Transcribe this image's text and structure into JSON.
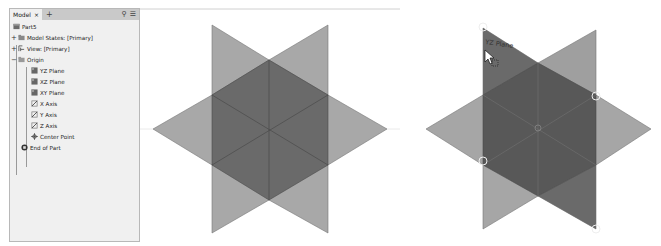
{
  "browser": {
    "tab_label": "Model",
    "tab_close": "×",
    "add_tab": "+",
    "search_icon": "search-icon",
    "menu_icon": "menu-icon",
    "tree": [
      {
        "label": "Part5",
        "icon": "part-icon",
        "level": 0
      },
      {
        "label": "Model States: [Primary]",
        "icon": "folder-icon",
        "level": 0,
        "expander": "+"
      },
      {
        "label": "View: [Primary]",
        "icon": "view-icon",
        "level": 0,
        "expander": "+"
      },
      {
        "label": "Origin",
        "icon": "folder-icon",
        "level": 0,
        "expander": "−"
      },
      {
        "label": "YZ Plane",
        "icon": "plane-icon",
        "level": 1
      },
      {
        "label": "XZ Plane",
        "icon": "plane-icon",
        "level": 1
      },
      {
        "label": "XY Plane",
        "icon": "plane-icon",
        "level": 1
      },
      {
        "label": "X Axis",
        "icon": "axis-icon",
        "level": 1
      },
      {
        "label": "Y Axis",
        "icon": "axis-icon",
        "level": 1
      },
      {
        "label": "Z Axis",
        "icon": "axis-icon",
        "level": 1
      },
      {
        "label": "Center Point",
        "icon": "point-icon",
        "level": 1
      },
      {
        "label": "End of Part",
        "icon": "end-of-part-icon",
        "level": 0
      }
    ]
  },
  "viewport": {
    "hover_label": "YZ Plane",
    "colors": {
      "plane_light": "#a9a9a9",
      "plane_dark": "#6b6b6b",
      "hex_dark": "#585858",
      "edge": "#5a5a5a"
    }
  }
}
